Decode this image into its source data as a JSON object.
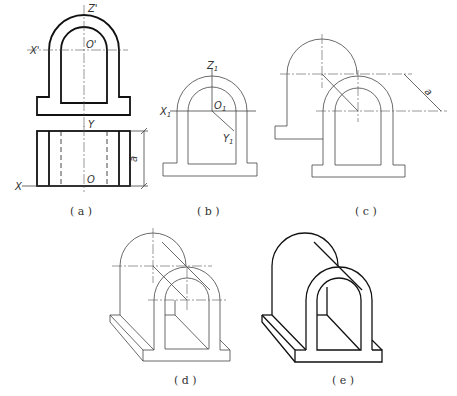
{
  "figure": {
    "panels": [
      {
        "id": "a",
        "caption": "( a )",
        "labels": {
          "z": "Z'",
          "x_top": "X'",
          "o_top": "O'",
          "y": "Y",
          "x": "X",
          "o": "O",
          "dim": "a"
        }
      },
      {
        "id": "b",
        "caption": "( b )",
        "labels": {
          "z": "Z",
          "x": "X",
          "o": "O",
          "y": "Y",
          "sub": "1"
        }
      },
      {
        "id": "c",
        "caption": "( c )",
        "labels": {
          "dim": "a"
        }
      },
      {
        "id": "d",
        "caption": "( d )"
      },
      {
        "id": "e",
        "caption": "( e )"
      }
    ]
  }
}
